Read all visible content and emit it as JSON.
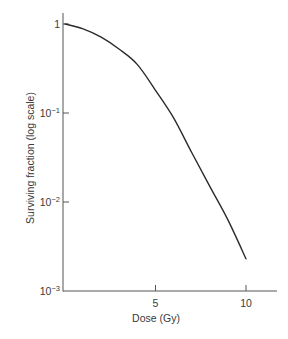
{
  "chart_data": {
    "type": "line",
    "title": "",
    "xlabel": "Dose (Gy)",
    "ylabel": "Surviving fraction (log scale)",
    "yscale": "log",
    "xlim": [
      0,
      11.5
    ],
    "ylim": [
      0.001,
      1.3
    ],
    "grid": false,
    "legend": null,
    "x_ticks": [
      {
        "value": 5,
        "label": "5"
      },
      {
        "value": 10,
        "label": "10"
      }
    ],
    "y_ticks": [
      {
        "value": 1,
        "base": "1",
        "exp": ""
      },
      {
        "value": 0.1,
        "base": "10",
        "exp": "−1"
      },
      {
        "value": 0.01,
        "base": "10",
        "exp": "−2"
      },
      {
        "value": 0.001,
        "base": "10",
        "exp": "−3"
      }
    ],
    "series": [
      {
        "name": "Cell survival curve",
        "color": "#2b2b2b",
        "x": [
          0,
          1,
          2,
          3,
          4,
          5,
          6,
          7,
          8,
          9,
          10
        ],
        "values": [
          1.0,
          0.88,
          0.71,
          0.52,
          0.35,
          0.18,
          0.088,
          0.036,
          0.015,
          0.0063,
          0.0023
        ]
      }
    ]
  },
  "colors": {
    "axis": "#555555",
    "curve": "#2b2b2b",
    "text": "#3a3a3a"
  }
}
